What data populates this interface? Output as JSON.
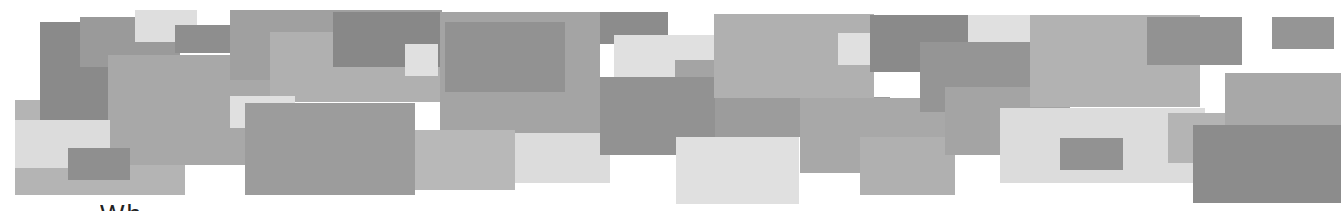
{
  "banner": {
    "description": "Collage of overlapping gray rectangles",
    "rects": [
      {
        "x": 15,
        "y": 100,
        "w": 170,
        "h": 95,
        "c": "#b4b4b4"
      },
      {
        "x": 40,
        "y": 22,
        "w": 75,
        "h": 98,
        "c": "#8a8a8a"
      },
      {
        "x": 80,
        "y": 17,
        "w": 100,
        "h": 50,
        "c": "#9a9a9a"
      },
      {
        "x": 135,
        "y": 10,
        "w": 62,
        "h": 32,
        "c": "#dedede"
      },
      {
        "x": 175,
        "y": 25,
        "w": 120,
        "h": 28,
        "c": "#8e8e8e"
      },
      {
        "x": 108,
        "y": 55,
        "w": 165,
        "h": 110,
        "c": "#a8a8a8"
      },
      {
        "x": 15,
        "y": 120,
        "w": 95,
        "h": 48,
        "c": "#dcdcdc"
      },
      {
        "x": 68,
        "y": 148,
        "w": 62,
        "h": 32,
        "c": "#8f8f8f"
      },
      {
        "x": 230,
        "y": 10,
        "w": 212,
        "h": 70,
        "c": "#a0a0a0"
      },
      {
        "x": 270,
        "y": 32,
        "w": 170,
        "h": 70,
        "c": "#b0b0b0"
      },
      {
        "x": 333,
        "y": 12,
        "w": 112,
        "h": 55,
        "c": "#888888"
      },
      {
        "x": 405,
        "y": 44,
        "w": 33,
        "h": 32,
        "c": "#e0e0e0"
      },
      {
        "x": 440,
        "y": 12,
        "w": 160,
        "h": 125,
        "c": "#a4a4a4"
      },
      {
        "x": 445,
        "y": 22,
        "w": 120,
        "h": 70,
        "c": "#929292"
      },
      {
        "x": 230,
        "y": 96,
        "w": 65,
        "h": 32,
        "c": "#e0e0e0"
      },
      {
        "x": 245,
        "y": 103,
        "w": 170,
        "h": 92,
        "c": "#9c9c9c"
      },
      {
        "x": 415,
        "y": 130,
        "w": 100,
        "h": 60,
        "c": "#b8b8b8"
      },
      {
        "x": 515,
        "y": 133,
        "w": 95,
        "h": 50,
        "c": "#dcdcdc"
      },
      {
        "x": 600,
        "y": 12,
        "w": 68,
        "h": 32,
        "c": "#8c8c8c"
      },
      {
        "x": 614,
        "y": 35,
        "w": 120,
        "h": 42,
        "c": "#e0e0e0"
      },
      {
        "x": 675,
        "y": 60,
        "w": 60,
        "h": 25,
        "c": "#a4a4a4"
      },
      {
        "x": 600,
        "y": 77,
        "w": 115,
        "h": 78,
        "c": "#929292"
      },
      {
        "x": 715,
        "y": 97,
        "w": 175,
        "h": 40,
        "c": "#9c9c9c"
      },
      {
        "x": 676,
        "y": 137,
        "w": 123,
        "h": 67,
        "c": "#e0e0e0"
      },
      {
        "x": 714,
        "y": 14,
        "w": 160,
        "h": 84,
        "c": "#b0b0b0"
      },
      {
        "x": 838,
        "y": 33,
        "w": 52,
        "h": 32,
        "c": "#e0e0e0"
      },
      {
        "x": 800,
        "y": 98,
        "w": 145,
        "h": 75,
        "c": "#a8a8a8"
      },
      {
        "x": 860,
        "y": 137,
        "w": 95,
        "h": 58,
        "c": "#b0b0b0"
      },
      {
        "x": 870,
        "y": 15,
        "w": 98,
        "h": 57,
        "c": "#8a8a8a"
      },
      {
        "x": 968,
        "y": 15,
        "w": 62,
        "h": 28,
        "c": "#e0e0e0"
      },
      {
        "x": 920,
        "y": 42,
        "w": 110,
        "h": 70,
        "c": "#959595"
      },
      {
        "x": 945,
        "y": 87,
        "w": 125,
        "h": 68,
        "c": "#a4a4a4"
      },
      {
        "x": 1030,
        "y": 15,
        "w": 170,
        "h": 92,
        "c": "#b2b2b2"
      },
      {
        "x": 1147,
        "y": 17,
        "w": 95,
        "h": 48,
        "c": "#929292"
      },
      {
        "x": 1000,
        "y": 108,
        "w": 205,
        "h": 75,
        "c": "#dcdcdc"
      },
      {
        "x": 1060,
        "y": 138,
        "w": 63,
        "h": 32,
        "c": "#929292"
      },
      {
        "x": 1168,
        "y": 113,
        "w": 60,
        "h": 50,
        "c": "#b4b4b4"
      },
      {
        "x": 1225,
        "y": 73,
        "w": 116,
        "h": 55,
        "c": "#a8a8a8"
      },
      {
        "x": 1272,
        "y": 17,
        "w": 62,
        "h": 32,
        "c": "#959595"
      },
      {
        "x": 1193,
        "y": 125,
        "w": 148,
        "h": 78,
        "c": "#8c8c8c"
      }
    ]
  },
  "caption": {
    "text": "Wh"
  }
}
